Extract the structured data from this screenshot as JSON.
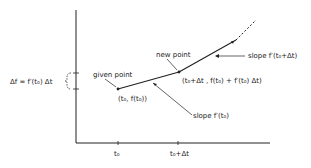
{
  "diagram": {
    "type": "euler-method-illustration",
    "labels": {
      "delta_f": "Δf = f′(t₀) Δt",
      "given_point": "given point",
      "given_coords": "(t₀, f(t₀))",
      "new_point": "new point",
      "new_coords": "(t₀+Δt , f(t₀) + f′(t₀) Δt)",
      "slope_initial": "slope f′(t₀)",
      "slope_next": "slope f′(t₀+Δt)",
      "tick_t0": "t₀",
      "tick_t0_dt": "t₀+Δt"
    },
    "points": {
      "given": [
        118,
        89
      ],
      "new": [
        179,
        72
      ],
      "next": [
        236,
        40
      ],
      "dash_end": [
        256,
        20
      ]
    },
    "colors": {
      "ink": "#222222",
      "background": "#ffffff"
    }
  }
}
